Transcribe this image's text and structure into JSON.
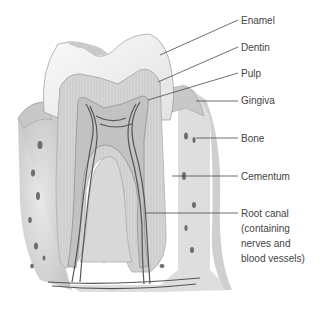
{
  "diagram": {
    "labels": [
      {
        "id": "enamel",
        "text": "Enamel"
      },
      {
        "id": "dentin",
        "text": "Dentin"
      },
      {
        "id": "pulp",
        "text": "Pulp"
      },
      {
        "id": "gingiva",
        "text": "Gingiva"
      },
      {
        "id": "bone",
        "text": "Bone"
      },
      {
        "id": "cementum",
        "text": "Cementum"
      },
      {
        "id": "root-canal",
        "lines": [
          "Root canal",
          "(containing",
          "nerves and",
          "blood vessels)"
        ]
      }
    ],
    "colors": {
      "leader_line": "#4a4a4a",
      "label_text": "#444444",
      "enamel": "#f2f2f2",
      "dentin": "#d4d4d4",
      "pulp": "#bdbdbd",
      "bone": "#dcdcdc",
      "vessel": "#555555"
    }
  }
}
